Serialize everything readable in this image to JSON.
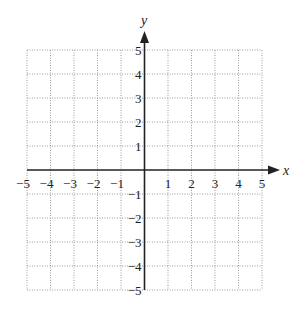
{
  "diagram": {
    "type": "coordinate-grid",
    "x_axis": {
      "label": "x",
      "min": -5,
      "max": 5,
      "ticks": [
        "-5",
        "-4",
        "-3",
        "-2",
        "-1",
        "1",
        "2",
        "3",
        "4",
        "5"
      ]
    },
    "y_axis": {
      "label": "y",
      "min": -5,
      "max": 5,
      "ticks": [
        "5",
        "4",
        "3",
        "2",
        "1",
        "-1",
        "-2",
        "-3",
        "-4",
        "-5"
      ]
    },
    "grid": "dotted",
    "colors": {
      "grid": "#9a9a9a",
      "axis": "#222222",
      "text": "#222222"
    }
  }
}
